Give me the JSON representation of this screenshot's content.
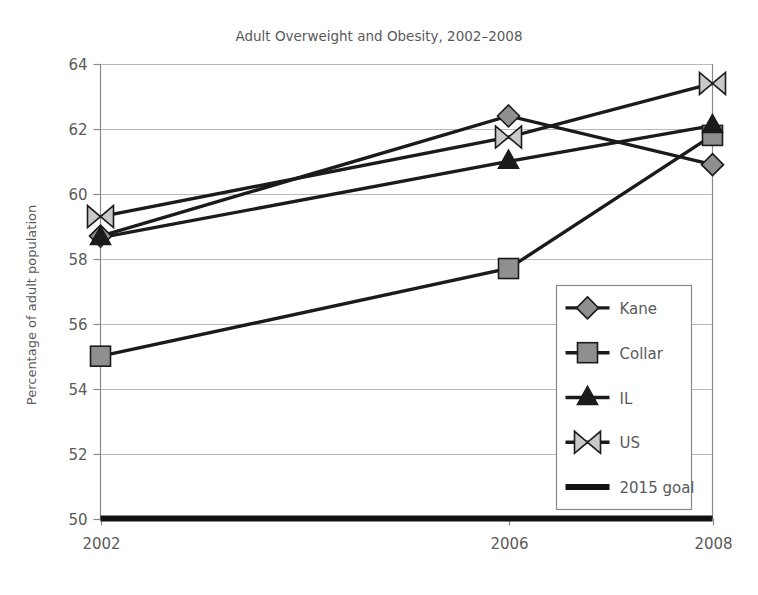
{
  "chart_data": {
    "type": "line",
    "title": "Adult Overweight and Obesity, 2002–2008",
    "xlabel": "",
    "ylabel": "Percentage of adult population",
    "x": [
      2002,
      2006,
      2008
    ],
    "xtick_labels": [
      "2002",
      "2006",
      "2008"
    ],
    "ytick_labels": [
      "50",
      "52",
      "54",
      "56",
      "58",
      "60",
      "62",
      "64"
    ],
    "yticks": [
      50,
      52,
      54,
      56,
      58,
      60,
      62,
      64
    ],
    "ylim": [
      50,
      64
    ],
    "xlim": [
      2002,
      2008
    ],
    "grid": "horizontal",
    "legend_position": "lower-right-inside",
    "series": [
      {
        "name": "Kane",
        "marker": "diamond",
        "marker_fill": "#8f8f8f",
        "values": [
          58.7,
          62.4,
          60.9
        ]
      },
      {
        "name": "Collar",
        "marker": "square",
        "marker_fill": "#8f8f8f",
        "values": [
          55.0,
          57.7,
          61.8
        ]
      },
      {
        "name": "IL",
        "marker": "triangle",
        "marker_fill": "#1b1b1b",
        "values": [
          58.65,
          61.0,
          62.1
        ]
      },
      {
        "name": "US",
        "marker": "bowtie",
        "marker_fill": "#c9c9c9",
        "values": [
          59.3,
          61.75,
          63.4
        ]
      },
      {
        "name": "2015 goal",
        "marker": "none",
        "marker_fill": "#111111",
        "values": [
          50.0,
          50.0,
          50.0
        ]
      }
    ]
  },
  "legend": {
    "items": [
      {
        "label": "Kane"
      },
      {
        "label": "Collar"
      },
      {
        "label": "IL"
      },
      {
        "label": "US"
      },
      {
        "label": "2015 goal"
      }
    ]
  },
  "colors": {
    "background": "#ffffff",
    "text": "#5a5a5a",
    "line": "#1b1b1b",
    "grid": "#b9b9b9",
    "axis": "#8a8a8a",
    "marker_gray": "#8f8f8f",
    "marker_light": "#c9c9c9",
    "marker_dark": "#1b1b1b"
  }
}
